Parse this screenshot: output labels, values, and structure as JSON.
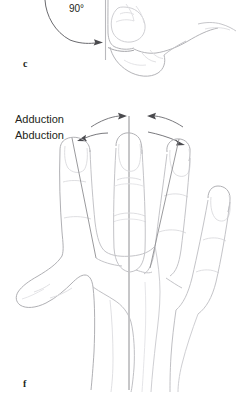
{
  "figure": {
    "panels": [
      {
        "letter": "c",
        "description": "metacarpophalangeal-flexion-90-degrees-lateral-view",
        "angle_label": "90°",
        "reference_line": "vertical-neutral-axis"
      },
      {
        "letter": "f",
        "description": "finger-adduction-abduction-dorsal-view",
        "reference_line": "vertical-axis-through-middle-finger",
        "motions": [
          {
            "name": "adduction",
            "label": "Adduction",
            "arrow_direction": "toward-midline"
          },
          {
            "name": "abduction",
            "label": "Abduction",
            "arrow_direction": "away-from-midline"
          }
        ]
      }
    ]
  },
  "colors": {
    "background": "#ffffff",
    "text": "#231f20",
    "outline": "#9a9a9e",
    "outline_light": "#c9c9cd",
    "outline_faint": "#dedee1",
    "arrow": "#5a5a5e",
    "axis_line": "#8e8e92"
  }
}
